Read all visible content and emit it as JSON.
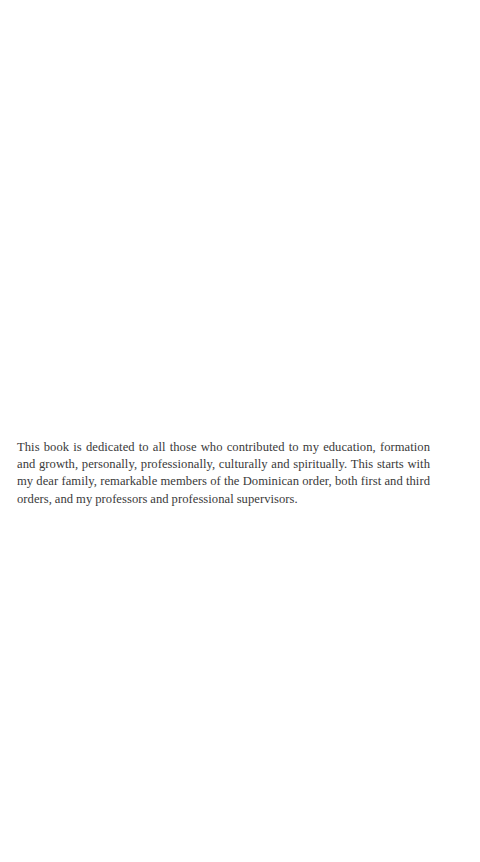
{
  "page": {
    "dedication": {
      "text": "This book is dedicated to all those who contributed to my education, formation and growth, personally, professionally, culturally and spiritually. This starts with my dear family,  remarkable members of the Dominican order, both first and third orders, and my professors and professional supervisors."
    }
  },
  "colors": {
    "background": "#ffffff",
    "text": "#3a3a3a"
  }
}
